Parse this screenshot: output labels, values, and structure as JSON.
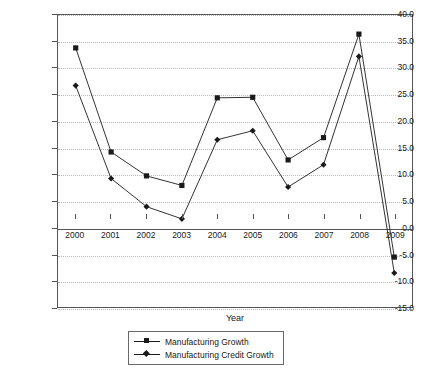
{
  "chart_data": {
    "type": "line",
    "title": "",
    "xlabel": "Year",
    "ylabel": "% per annum",
    "categories": [
      "2000",
      "2001",
      "2002",
      "2003",
      "2004",
      "2005",
      "2006",
      "2007",
      "2008",
      "2009"
    ],
    "ylim": [
      -15.0,
      40.0
    ],
    "ytick_values": [
      40.0,
      35.0,
      30.0,
      25.0,
      20.0,
      15.0,
      10.0,
      5.0,
      0.0,
      -5.0,
      -10.0,
      -15.0
    ],
    "ytick_labels": [
      "40.0",
      "35.0",
      "30.0",
      "25.0",
      "20.0",
      "15.0",
      "10.0",
      "5.0",
      "0.0",
      "-5.0",
      "-10.0",
      "-15.0"
    ],
    "grid": true,
    "legend_position": "bottom-center",
    "series": [
      {
        "name": "Manufacturing Growth",
        "marker": "square",
        "color": "#1a1a1a",
        "values": [
          33.8,
          14.2,
          9.7,
          7.9,
          24.4,
          24.5,
          12.7,
          16.9,
          36.4,
          -5.6
        ]
      },
      {
        "name": "Manufacturing Credit Growth",
        "marker": "diamond",
        "color": "#1a1a1a",
        "values": [
          26.7,
          9.2,
          3.9,
          1.6,
          16.5,
          18.2,
          7.6,
          11.8,
          32.2,
          -8.6
        ]
      }
    ]
  }
}
